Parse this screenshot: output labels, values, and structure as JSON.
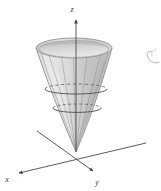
{
  "figure": {
    "kind": "3d-surface-plot",
    "title": "",
    "background_color": "#ffffff",
    "width": 161,
    "height": 191
  },
  "axes": {
    "z": {
      "label": "z",
      "direction": "up",
      "arrow": true,
      "tip": {
        "x": 76,
        "y": 19
      },
      "origin": {
        "x": 76,
        "y": 152
      },
      "label_pos": {
        "x": 74,
        "y": 15
      }
    },
    "x": {
      "label": "x",
      "direction": "down-left",
      "arrow": true,
      "tip": {
        "x": 18,
        "y": 173
      },
      "tail": {
        "x": 146,
        "y": 143
      },
      "label_pos": {
        "x": 6,
        "y": 180
      }
    },
    "y": {
      "label": "y",
      "direction": "down-right",
      "arrow": true,
      "tip": {
        "x": 93,
        "y": 171
      },
      "tail": {
        "x": 37,
        "y": 131
      },
      "label_pos": {
        "x": 96,
        "y": 183
      }
    }
  },
  "surface": {
    "name": "cone",
    "apex": {
      "x": 76,
      "y": 152
    },
    "rim_center": {
      "x": 74,
      "y": 48
    },
    "rim_rx": 38,
    "rim_ry": 10,
    "fill_outer": "#c9c9c9",
    "fill_inner": "#dcdcdc",
    "stroke": "#8c8c8c",
    "grid_line_color": "#8f8f8f",
    "grid_line_count": 7
  },
  "cross_sections": [
    {
      "name": "upper-cross-section",
      "center": {
        "x": 76,
        "y": 89
      },
      "rx": 31,
      "ry": 5,
      "back_arc_style": "dashed",
      "front_arc_style": "solid",
      "stroke": "#6e6e6e"
    },
    {
      "name": "lower-cross-section",
      "center": {
        "x": 77,
        "y": 108
      },
      "rx": 24,
      "ry": 4,
      "back_arc_style": "dashed",
      "front_arc_style": "solid",
      "stroke": "#6e6e6e"
    }
  ],
  "annotation": {
    "name": "edge-pen-mark",
    "description": "faint partial hand-drawn mark clipped at the right edge",
    "color": "#9a9a9a"
  },
  "colors": {
    "ink": "#3a3a3a",
    "surface_light": "#e3e3e3",
    "surface_mid": "#cdcdcd",
    "surface_dark": "#b4b4b4",
    "axis": "#4a4a4a"
  }
}
